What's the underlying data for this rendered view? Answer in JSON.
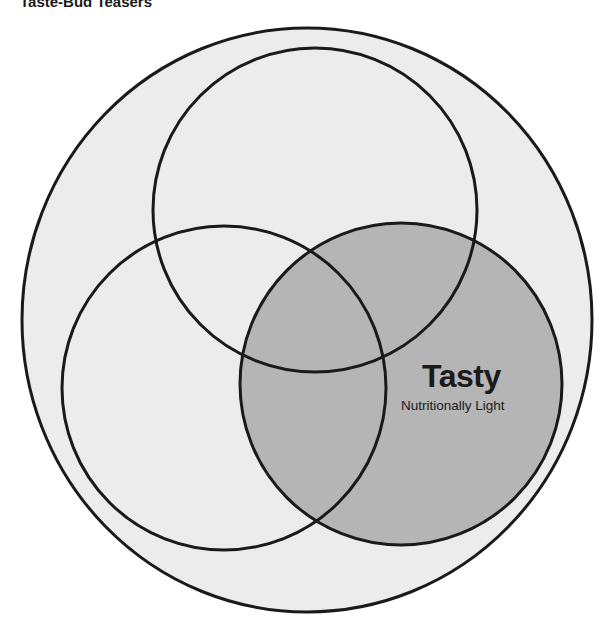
{
  "title": "Taste-Bud Teasers",
  "diagram": {
    "type": "venn",
    "colors": {
      "outer_fill": "#ececec",
      "highlight_fill": "#b5b5b5",
      "stroke": "#1a1a1a",
      "background": "#ffffff"
    },
    "circles": [
      {
        "name": "outer",
        "cx": 307,
        "cy": 320,
        "rx": 285,
        "ry": 292
      },
      {
        "name": "top",
        "cx": 315,
        "cy": 210,
        "r": 162
      },
      {
        "name": "left",
        "cx": 224,
        "cy": 388,
        "r": 162
      },
      {
        "name": "right",
        "cx": 401,
        "cy": 384,
        "r": 161,
        "highlighted": true
      }
    ],
    "highlight_label": {
      "title": "Tasty",
      "subtitle": "Nutritionally Light"
    }
  }
}
